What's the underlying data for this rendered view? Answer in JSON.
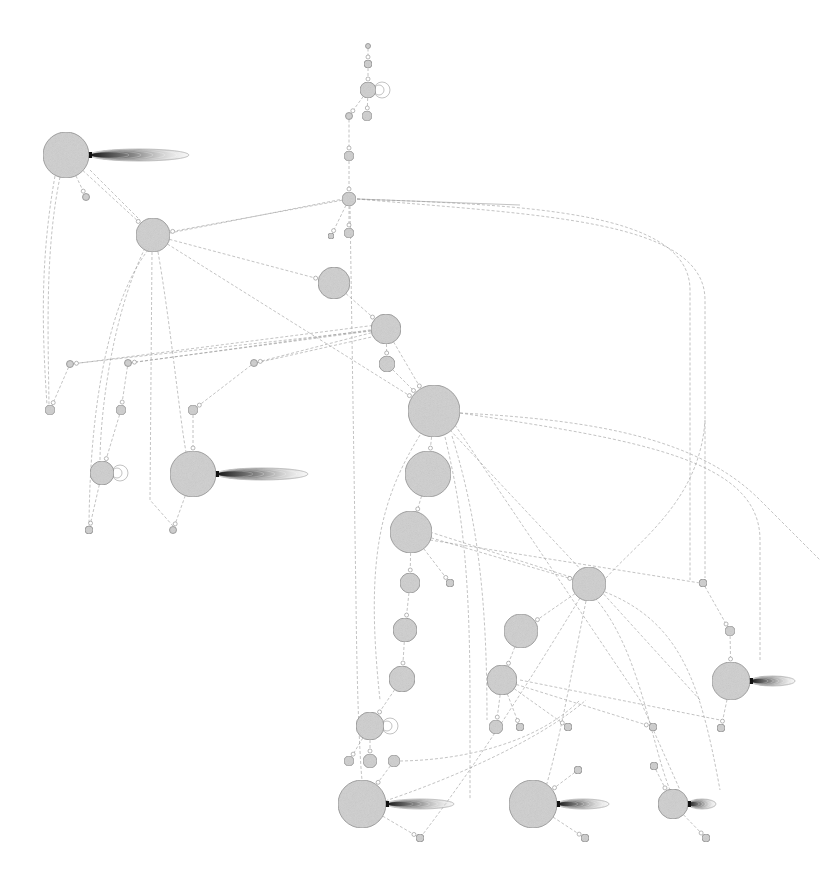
{
  "diagram": {
    "type": "network-graph",
    "background": "#ffffff",
    "node_fill": "#cfcfcf",
    "node_stroke": "#8a8a8a",
    "edge_color": "#9a9a9a",
    "tail_color": "#1a1a1a",
    "nodes": [
      {
        "id": "n1",
        "x": 368,
        "y": 46,
        "r": 2.5
      },
      {
        "id": "n2",
        "x": 368,
        "y": 64,
        "r": 4
      },
      {
        "id": "n3",
        "x": 368,
        "y": 90,
        "r": 8
      },
      {
        "id": "n4",
        "x": 367,
        "y": 116,
        "r": 5
      },
      {
        "id": "n5",
        "x": 349,
        "y": 116,
        "r": 3.5
      },
      {
        "id": "n6",
        "x": 349,
        "y": 156,
        "r": 5
      },
      {
        "id": "n7",
        "x": 349,
        "y": 199,
        "r": 7
      },
      {
        "id": "n8",
        "x": 349,
        "y": 233,
        "r": 5
      },
      {
        "id": "n9",
        "x": 331,
        "y": 236,
        "r": 3
      },
      {
        "id": "n10",
        "x": 66,
        "y": 155,
        "r": 23
      },
      {
        "id": "n11",
        "x": 86,
        "y": 197,
        "r": 3.5
      },
      {
        "id": "n12",
        "x": 153,
        "y": 235,
        "r": 17
      },
      {
        "id": "n13",
        "x": 334,
        "y": 283,
        "r": 16
      },
      {
        "id": "n14",
        "x": 386,
        "y": 329,
        "r": 15
      },
      {
        "id": "n15",
        "x": 387,
        "y": 364,
        "r": 8
      },
      {
        "id": "n16",
        "x": 434,
        "y": 411,
        "r": 26
      },
      {
        "id": "n17",
        "x": 428,
        "y": 474,
        "r": 23
      },
      {
        "id": "n18",
        "x": 411,
        "y": 532,
        "r": 21
      },
      {
        "id": "n19",
        "x": 410,
        "y": 583,
        "r": 10
      },
      {
        "id": "n20",
        "x": 450,
        "y": 583,
        "r": 4
      },
      {
        "id": "n21",
        "x": 405,
        "y": 630,
        "r": 12
      },
      {
        "id": "n22",
        "x": 402,
        "y": 679,
        "r": 13
      },
      {
        "id": "n23",
        "x": 370,
        "y": 726,
        "r": 14
      },
      {
        "id": "n24",
        "x": 349,
        "y": 761,
        "r": 5
      },
      {
        "id": "n25",
        "x": 370,
        "y": 761,
        "r": 7
      },
      {
        "id": "n26",
        "x": 394,
        "y": 761,
        "r": 6
      },
      {
        "id": "n27",
        "x": 362,
        "y": 804,
        "r": 24
      },
      {
        "id": "n28",
        "x": 420,
        "y": 838,
        "r": 4
      },
      {
        "id": "n29",
        "x": 589,
        "y": 584,
        "r": 17
      },
      {
        "id": "n30",
        "x": 521,
        "y": 631,
        "r": 17
      },
      {
        "id": "n31",
        "x": 502,
        "y": 680,
        "r": 15
      },
      {
        "id": "n32",
        "x": 496,
        "y": 727,
        "r": 7
      },
      {
        "id": "n33",
        "x": 520,
        "y": 727,
        "r": 4
      },
      {
        "id": "n34",
        "x": 568,
        "y": 727,
        "r": 4
      },
      {
        "id": "n35",
        "x": 653,
        "y": 727,
        "r": 4
      },
      {
        "id": "n36",
        "x": 578,
        "y": 770,
        "r": 4
      },
      {
        "id": "n37",
        "x": 533,
        "y": 804,
        "r": 24
      },
      {
        "id": "n38",
        "x": 585,
        "y": 838,
        "r": 4
      },
      {
        "id": "n39",
        "x": 654,
        "y": 766,
        "r": 4
      },
      {
        "id": "n40",
        "x": 673,
        "y": 804,
        "r": 15
      },
      {
        "id": "n41",
        "x": 706,
        "y": 838,
        "r": 4
      },
      {
        "id": "n42",
        "x": 703,
        "y": 583,
        "r": 4
      },
      {
        "id": "n43",
        "x": 730,
        "y": 631,
        "r": 5
      },
      {
        "id": "n44",
        "x": 731,
        "y": 681,
        "r": 19
      },
      {
        "id": "n45",
        "x": 721,
        "y": 728,
        "r": 4
      },
      {
        "id": "n46",
        "x": 70,
        "y": 364,
        "r": 3.5
      },
      {
        "id": "n47",
        "x": 50,
        "y": 410,
        "r": 5
      },
      {
        "id": "n48",
        "x": 128,
        "y": 363,
        "r": 3.5
      },
      {
        "id": "n49",
        "x": 121,
        "y": 410,
        "r": 5
      },
      {
        "id": "n50",
        "x": 102,
        "y": 473,
        "r": 12
      },
      {
        "id": "n51",
        "x": 89,
        "y": 530,
        "r": 4
      },
      {
        "id": "n52",
        "x": 193,
        "y": 410,
        "r": 5
      },
      {
        "id": "n53",
        "x": 254,
        "y": 363,
        "r": 3.5
      },
      {
        "id": "n54",
        "x": 193,
        "y": 474,
        "r": 23
      },
      {
        "id": "n55",
        "x": 173,
        "y": 530,
        "r": 3.5
      }
    ],
    "tails": [
      {
        "node": "n10",
        "x": 89,
        "y": 155,
        "length": 100,
        "thickness": 12
      },
      {
        "node": "n54",
        "x": 216,
        "y": 474,
        "length": 92,
        "thickness": 12
      },
      {
        "node": "n27",
        "x": 386,
        "y": 804,
        "length": 68,
        "thickness": 10
      },
      {
        "node": "n37",
        "x": 557,
        "y": 804,
        "length": 52,
        "thickness": 10
      },
      {
        "node": "n40",
        "x": 688,
        "y": 804,
        "length": 28,
        "thickness": 10
      },
      {
        "node": "n44",
        "x": 750,
        "y": 681,
        "length": 45,
        "thickness": 10
      }
    ],
    "self_loops": [
      {
        "node": "n3",
        "x": 376,
        "y": 90
      },
      {
        "node": "n50",
        "x": 114,
        "y": 473
      },
      {
        "node": "n23",
        "x": 384,
        "y": 726
      }
    ],
    "edges": [
      {
        "from": "n1",
        "to": "n2"
      },
      {
        "from": "n2",
        "to": "n3"
      },
      {
        "from": "n3",
        "to": "n4"
      },
      {
        "from": "n3",
        "to": "n5"
      },
      {
        "from": "n5",
        "to": "n6"
      },
      {
        "from": "n6",
        "to": "n7"
      },
      {
        "from": "n7",
        "to": "n8"
      },
      {
        "from": "n7",
        "to": "n9"
      },
      {
        "from": "n7",
        "to": "n12"
      },
      {
        "from": "n10",
        "to": "n12"
      },
      {
        "from": "n10",
        "to": "n11"
      },
      {
        "from": "n12",
        "to": "n13"
      },
      {
        "from": "n13",
        "to": "n14"
      },
      {
        "from": "n14",
        "to": "n15"
      },
      {
        "from": "n14",
        "to": "n16"
      },
      {
        "from": "n15",
        "to": "n16"
      },
      {
        "from": "n16",
        "to": "n17"
      },
      {
        "from": "n17",
        "to": "n18"
      },
      {
        "from": "n18",
        "to": "n19"
      },
      {
        "from": "n18",
        "to": "n20"
      },
      {
        "from": "n18",
        "to": "n29"
      },
      {
        "from": "n19",
        "to": "n21"
      },
      {
        "from": "n21",
        "to": "n22"
      },
      {
        "from": "n22",
        "to": "n23"
      },
      {
        "from": "n23",
        "to": "n24"
      },
      {
        "from": "n23",
        "to": "n25"
      },
      {
        "from": "n26",
        "to": "n27"
      },
      {
        "from": "n27",
        "to": "n28"
      },
      {
        "from": "n29",
        "to": "n30"
      },
      {
        "from": "n30",
        "to": "n31"
      },
      {
        "from": "n31",
        "to": "n32"
      },
      {
        "from": "n31",
        "to": "n33"
      },
      {
        "from": "n31",
        "to": "n34"
      },
      {
        "from": "n31",
        "to": "n35"
      },
      {
        "from": "n36",
        "to": "n37"
      },
      {
        "from": "n37",
        "to": "n38"
      },
      {
        "from": "n39",
        "to": "n40"
      },
      {
        "from": "n40",
        "to": "n41"
      },
      {
        "from": "n42",
        "to": "n43"
      },
      {
        "from": "n43",
        "to": "n44"
      },
      {
        "from": "n44",
        "to": "n45"
      },
      {
        "from": "n46",
        "to": "n47"
      },
      {
        "from": "n48",
        "to": "n49"
      },
      {
        "from": "n49",
        "to": "n50"
      },
      {
        "from": "n50",
        "to": "n51"
      },
      {
        "from": "n52",
        "to": "n54"
      },
      {
        "from": "n53",
        "to": "n52"
      },
      {
        "from": "n54",
        "to": "n55"
      },
      {
        "from": "n12",
        "to": "n16"
      },
      {
        "from": "n14",
        "to": "n46"
      },
      {
        "from": "n14",
        "to": "n48"
      },
      {
        "from": "n14",
        "to": "n53"
      }
    ]
  }
}
